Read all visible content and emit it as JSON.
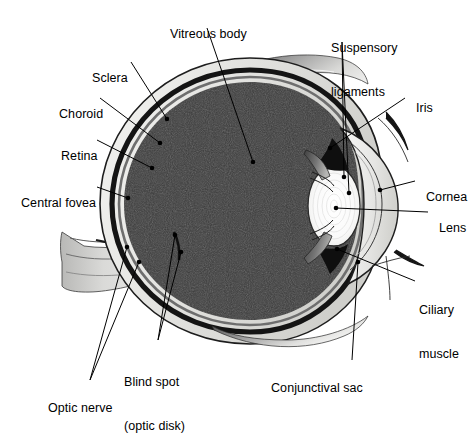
{
  "figure": {
    "type": "anatomical-diagram",
    "background": "#ffffff",
    "palette": {
      "vitreous": "#3a3a3a",
      "choroid": "#1a1a1a",
      "sclera": "#e8e8e6",
      "retina": "#6b6b6b",
      "lens": "#fbfbfb",
      "iris": "#111111",
      "conjunctiva": "#9a9a9a",
      "leader_line": "#000000",
      "text": "#000000"
    }
  },
  "labels": [
    {
      "id": "vitreous-body",
      "text": "Vitreous body",
      "line2": "",
      "x": 163,
      "y": 12,
      "align": "left"
    },
    {
      "id": "suspensory",
      "text": "Suspensory",
      "line2": "ligaments",
      "x": 331,
      "y": 12,
      "align": "left"
    },
    {
      "id": "sclera",
      "text": "Sclera",
      "line2": "",
      "x": 85,
      "y": 56,
      "align": "left"
    },
    {
      "id": "iris",
      "text": "Iris",
      "line2": "",
      "x": 409,
      "y": 86,
      "align": "left"
    },
    {
      "id": "choroid",
      "text": "Choroid",
      "line2": "",
      "x": 52,
      "y": 92,
      "align": "left"
    },
    {
      "id": "retina",
      "text": "Retina",
      "line2": "",
      "x": 54,
      "y": 134,
      "align": "left"
    },
    {
      "id": "cornea",
      "text": "Cornea",
      "line2": "",
      "x": 419,
      "y": 175,
      "align": "left"
    },
    {
      "id": "central-fovea",
      "text": "Central fovea",
      "line2": "",
      "x": 14,
      "y": 181,
      "align": "left"
    },
    {
      "id": "lens",
      "text": "Lens",
      "line2": "",
      "x": 432,
      "y": 206,
      "align": "left"
    },
    {
      "id": "ciliary-muscle",
      "text": "Ciliary",
      "line2": "muscle",
      "x": 419,
      "y": 274,
      "align": "left"
    },
    {
      "id": "blind-spot",
      "text": "Blind spot",
      "line2": "(optic disk)",
      "x": 124,
      "y": 346,
      "align": "left"
    },
    {
      "id": "conjunctival-sac",
      "text": "Conjunctival sac",
      "line2": "",
      "x": 264,
      "y": 366,
      "align": "left"
    },
    {
      "id": "optic-nerve",
      "text": "Optic nerve",
      "line2": "",
      "x": 41,
      "y": 386,
      "align": "left"
    }
  ],
  "structures": [
    {
      "id": "vitreous-body",
      "name": "Vitreous body",
      "description": "Large dark gelatinous chamber filling the posterior globe"
    },
    {
      "id": "sclera",
      "name": "Sclera",
      "description": "Outer pale fibrous coat of the eyeball"
    },
    {
      "id": "choroid",
      "name": "Choroid",
      "description": "Dark vascular layer beneath the sclera"
    },
    {
      "id": "retina",
      "name": "Retina",
      "description": "Innermost light-sensitive layer"
    },
    {
      "id": "central-fovea",
      "name": "Central fovea",
      "description": "Point of sharpest vision on the retina"
    },
    {
      "id": "optic-nerve",
      "name": "Optic nerve",
      "description": "Nerve bundle exiting posteriorly to the left"
    },
    {
      "id": "blind-spot",
      "name": "Blind spot (optic disk)",
      "description": "Optic nerve head with no photoreceptors"
    },
    {
      "id": "lens",
      "name": "Lens",
      "description": "Biconvex transparent body behind the iris"
    },
    {
      "id": "iris",
      "name": "Iris",
      "description": "Pigmented diaphragm controlling the pupil"
    },
    {
      "id": "cornea",
      "name": "Cornea",
      "description": "Transparent anterior dome of the eye"
    },
    {
      "id": "suspensory-ligaments",
      "name": "Suspensory ligaments",
      "description": "Zonular fibres anchoring the lens"
    },
    {
      "id": "ciliary-muscle",
      "name": "Ciliary muscle",
      "description": "Muscle altering lens curvature for accommodation"
    },
    {
      "id": "conjunctival-sac",
      "name": "Conjunctival sac",
      "description": "Space between eyelid conjunctiva and globe"
    }
  ]
}
